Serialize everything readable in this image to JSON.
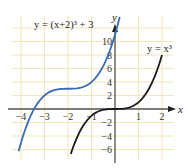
{
  "chart_data": {
    "type": "line",
    "title": "",
    "xlabel": "x",
    "ylabel": "y",
    "xlim": [
      -4.4,
      2.5
    ],
    "ylim": [
      -7.5,
      13.8
    ],
    "grid": true,
    "x_ticks": [
      -4,
      -3,
      -2,
      -1,
      1,
      2
    ],
    "x_tick_labels": [
      "−4",
      "−3",
      "−2",
      "−1",
      "1",
      "2"
    ],
    "y_ticks": [
      -6,
      -4,
      -2,
      2,
      4,
      6,
      8,
      10
    ],
    "y_tick_labels": [
      "−6",
      "−4",
      "−2",
      "2",
      "4",
      "6",
      "8",
      "10"
    ],
    "series": [
      {
        "name": "y = (x+2)^3 + 3",
        "label_text": "y = (x+2)³ + 3",
        "formula": "(x+2)^3+3",
        "x_range": [
          -4.1,
          0.2
        ],
        "color": "#3b6db3"
      },
      {
        "name": "y = x^3",
        "label_text": "y = x³",
        "formula": "x^3",
        "x_range": [
          -1.88,
          2.0
        ],
        "color": "#1a1a1a"
      }
    ],
    "colors": {
      "grid": "#f3e6b8",
      "axis": "#555555"
    }
  }
}
